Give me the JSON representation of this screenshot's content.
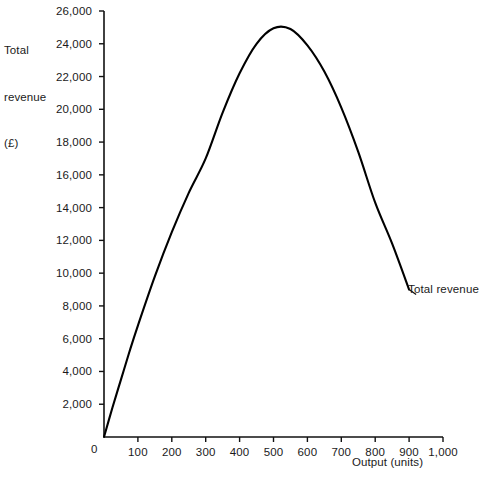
{
  "chart_data": {
    "type": "line",
    "title": "",
    "ylabel_lines": [
      "Total",
      "revenue",
      "(£)"
    ],
    "ylabel": "Total revenue (£)",
    "xlabel": "Output (units)",
    "xlim": [
      0,
      1000
    ],
    "ylim": [
      0,
      26000
    ],
    "grid": false,
    "legend": "none",
    "origin_label": "0",
    "x_ticks": [
      {
        "value": 100,
        "label": "100"
      },
      {
        "value": 200,
        "label": "200"
      },
      {
        "value": 300,
        "label": "300"
      },
      {
        "value": 400,
        "label": "400"
      },
      {
        "value": 500,
        "label": "500"
      },
      {
        "value": 600,
        "label": "600"
      },
      {
        "value": 700,
        "label": "700"
      },
      {
        "value": 800,
        "label": "800"
      },
      {
        "value": 900,
        "label": "900"
      },
      {
        "value": 1000,
        "label": "1,000"
      }
    ],
    "y_ticks": [
      {
        "value": 2000,
        "label": "2,000"
      },
      {
        "value": 4000,
        "label": "4,000"
      },
      {
        "value": 6000,
        "label": "6,000"
      },
      {
        "value": 8000,
        "label": "8,000"
      },
      {
        "value": 10000,
        "label": "10,000"
      },
      {
        "value": 12000,
        "label": "12,000"
      },
      {
        "value": 14000,
        "label": "14,000"
      },
      {
        "value": 16000,
        "label": "16,000"
      },
      {
        "value": 18000,
        "label": "18,000"
      },
      {
        "value": 20000,
        "label": "20,000"
      },
      {
        "value": 22000,
        "label": "22,000"
      },
      {
        "value": 24000,
        "label": "24,000"
      },
      {
        "value": 26000,
        "label": "26,000"
      }
    ],
    "series": [
      {
        "name": "Total revenue",
        "annotation": "Total revenue",
        "color": "#000000",
        "x": [
          0,
          25,
          50,
          75,
          100,
          150,
          200,
          250,
          300,
          350,
          400,
          450,
          500,
          550,
          600,
          650,
          700,
          750,
          800,
          850,
          900
        ],
        "values": [
          0,
          1800,
          3500,
          5200,
          6800,
          9800,
          12500,
          14900,
          17000,
          19800,
          22200,
          24000,
          24950,
          24900,
          23900,
          22300,
          20100,
          17400,
          14300,
          11800,
          9000
        ]
      }
    ]
  }
}
